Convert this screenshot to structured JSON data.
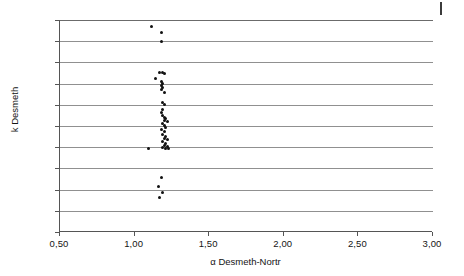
{
  "chart_data": {
    "type": "scatter",
    "title": "",
    "xlabel": "α Desmeth-Nortr",
    "ylabel": "k Desmeth",
    "xlim": [
      0.5,
      3.0
    ],
    "ylim": [
      0.0,
      10.0
    ],
    "xticks": [
      0.5,
      1.0,
      1.5,
      2.0,
      2.5,
      3.0
    ],
    "xtick_labels": [
      "0,50",
      "1,00",
      "1,50",
      "2,00",
      "2,50",
      "3,00"
    ],
    "yticks": [
      0,
      1,
      2,
      3,
      4,
      5,
      6,
      7,
      8,
      9,
      10
    ],
    "ytick_labels": [
      "0,00",
      "1,00",
      "2,00",
      "3,00",
      "4,00",
      "5,00",
      "6,00",
      "7,00",
      "8,00",
      "9,00",
      "10,00"
    ],
    "grid": "horizontal",
    "legend": "none",
    "marker_color": "#111111",
    "grid_color": "#909090",
    "axis_color": "#555555",
    "points": [
      {
        "x": 1.11,
        "y": 9.7
      },
      {
        "x": 1.18,
        "y": 9.42
      },
      {
        "x": 1.18,
        "y": 8.98
      },
      {
        "x": 1.17,
        "y": 7.53
      },
      {
        "x": 1.19,
        "y": 7.52
      },
      {
        "x": 1.2,
        "y": 7.5
      },
      {
        "x": 1.14,
        "y": 7.22
      },
      {
        "x": 1.18,
        "y": 7.08
      },
      {
        "x": 1.19,
        "y": 7.02
      },
      {
        "x": 1.18,
        "y": 6.92
      },
      {
        "x": 1.19,
        "y": 6.83
      },
      {
        "x": 1.18,
        "y": 6.72
      },
      {
        "x": 1.2,
        "y": 6.6
      },
      {
        "x": 1.19,
        "y": 6.1
      },
      {
        "x": 1.2,
        "y": 6.02
      },
      {
        "x": 1.19,
        "y": 5.78
      },
      {
        "x": 1.18,
        "y": 5.62
      },
      {
        "x": 1.19,
        "y": 5.5
      },
      {
        "x": 1.2,
        "y": 5.42
      },
      {
        "x": 1.21,
        "y": 5.35
      },
      {
        "x": 1.2,
        "y": 5.28
      },
      {
        "x": 1.22,
        "y": 5.2
      },
      {
        "x": 1.19,
        "y": 5.12
      },
      {
        "x": 1.2,
        "y": 5.02
      },
      {
        "x": 1.21,
        "y": 4.94
      },
      {
        "x": 1.18,
        "y": 4.85
      },
      {
        "x": 1.2,
        "y": 4.72
      },
      {
        "x": 1.19,
        "y": 4.6
      },
      {
        "x": 1.21,
        "y": 4.52
      },
      {
        "x": 1.2,
        "y": 4.42
      },
      {
        "x": 1.22,
        "y": 4.35
      },
      {
        "x": 1.19,
        "y": 4.28
      },
      {
        "x": 1.21,
        "y": 4.18
      },
      {
        "x": 1.2,
        "y": 4.1
      },
      {
        "x": 1.22,
        "y": 4.04
      },
      {
        "x": 1.19,
        "y": 3.98
      },
      {
        "x": 1.21,
        "y": 3.94
      },
      {
        "x": 1.23,
        "y": 3.92
      },
      {
        "x": 1.09,
        "y": 3.96
      },
      {
        "x": 1.18,
        "y": 2.55
      },
      {
        "x": 1.16,
        "y": 2.15
      },
      {
        "x": 1.19,
        "y": 1.85
      },
      {
        "x": 1.17,
        "y": 1.62
      }
    ]
  }
}
